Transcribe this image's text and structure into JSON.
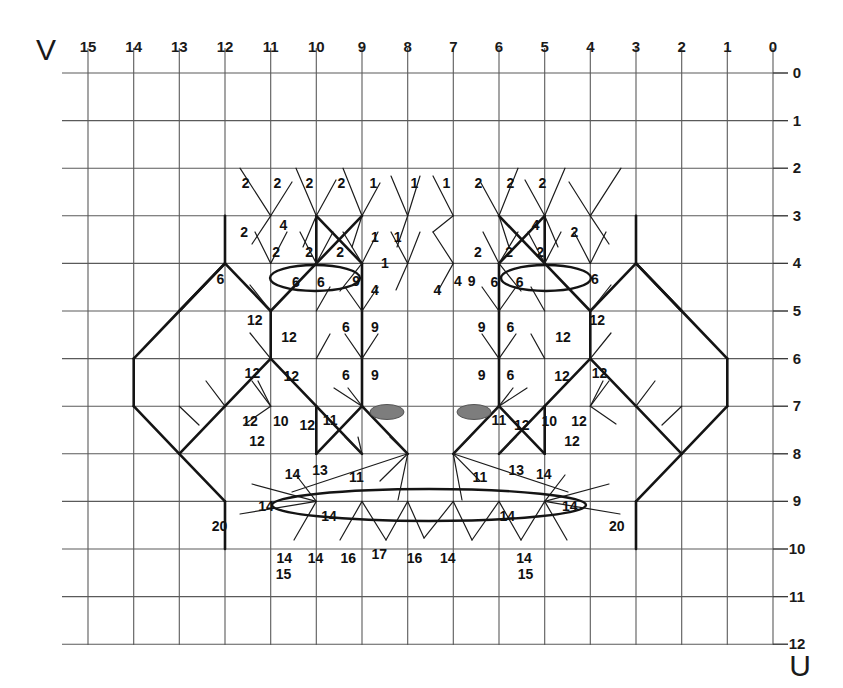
{
  "figure": {
    "axis_v_label": "V",
    "axis_u_label": "U",
    "top_ticks": [
      "15",
      "14",
      "13",
      "12",
      "11",
      "10",
      "9",
      "8",
      "7",
      "6",
      "5",
      "4",
      "3",
      "2",
      "1",
      "0"
    ],
    "right_ticks": [
      "0",
      "1",
      "2",
      "3",
      "4",
      "5",
      "6",
      "7",
      "8",
      "9",
      "10",
      "11",
      "12"
    ],
    "grid_color": "#555555",
    "line_color": "#111111",
    "marker_color": "#7d7d7d"
  },
  "chart_data": {
    "type": "diagram",
    "title": "",
    "xlabel": "V",
    "ylabel": "U",
    "x_ticks": [
      15,
      14,
      13,
      12,
      11,
      10,
      9,
      8,
      7,
      6,
      5,
      4,
      3,
      2,
      1,
      0
    ],
    "y_ticks": [
      0,
      1,
      2,
      3,
      4,
      5,
      6,
      7,
      8,
      9,
      10,
      11,
      12
    ],
    "xlim": [
      15,
      0
    ],
    "ylim": [
      0,
      12
    ],
    "grid": true,
    "x_axis_direction": "descending-left-to-right",
    "annotations": [
      {
        "text": "2",
        "u": 11.55,
        "v": 2.42
      },
      {
        "text": "2",
        "u": 10.85,
        "v": 2.42
      },
      {
        "text": "2",
        "u": 10.15,
        "v": 2.42
      },
      {
        "text": "2",
        "u": 9.45,
        "v": 2.42
      },
      {
        "text": "1",
        "u": 8.75,
        "v": 2.42
      },
      {
        "text": "1",
        "u": 7.85,
        "v": 2.42
      },
      {
        "text": "1",
        "u": 7.15,
        "v": 2.42
      },
      {
        "text": "2",
        "u": 6.45,
        "v": 2.42
      },
      {
        "text": "2",
        "u": 5.75,
        "v": 2.42
      },
      {
        "text": "2",
        "u": 5.05,
        "v": 2.42
      },
      {
        "text": "2",
        "u": 11.58,
        "v": 3.45
      },
      {
        "text": "4",
        "u": 10.72,
        "v": 3.3
      },
      {
        "text": "4",
        "u": 5.2,
        "v": 3.3
      },
      {
        "text": "2",
        "u": 4.35,
        "v": 3.45
      },
      {
        "text": "2",
        "u": 10.88,
        "v": 3.86
      },
      {
        "text": "2",
        "u": 10.16,
        "v": 3.86
      },
      {
        "text": "2",
        "u": 9.48,
        "v": 3.86
      },
      {
        "text": "1",
        "u": 8.72,
        "v": 3.56
      },
      {
        "text": "1",
        "u": 8.22,
        "v": 3.56
      },
      {
        "text": "2",
        "u": 6.46,
        "v": 3.86
      },
      {
        "text": "2",
        "u": 5.78,
        "v": 3.86
      },
      {
        "text": "2",
        "u": 5.1,
        "v": 3.86
      },
      {
        "text": "6",
        "u": 12.1,
        "v": 4.44
      },
      {
        "text": "6",
        "u": 10.45,
        "v": 4.5
      },
      {
        "text": "6",
        "u": 9.9,
        "v": 4.5
      },
      {
        "text": "9",
        "u": 9.13,
        "v": 4.47
      },
      {
        "text": "4",
        "u": 8.72,
        "v": 4.66
      },
      {
        "text": "4",
        "u": 7.35,
        "v": 4.66
      },
      {
        "text": "1",
        "u": 8.5,
        "v": 4.1
      },
      {
        "text": "4",
        "u": 6.9,
        "v": 4.47
      },
      {
        "text": "9",
        "u": 6.6,
        "v": 4.47
      },
      {
        "text": "6",
        "u": 6.1,
        "v": 4.5
      },
      {
        "text": "6",
        "u": 5.55,
        "v": 4.5
      },
      {
        "text": "6",
        "u": 3.9,
        "v": 4.44
      },
      {
        "text": "12",
        "u": 11.35,
        "v": 5.3
      },
      {
        "text": "12",
        "u": 10.6,
        "v": 5.65
      },
      {
        "text": "6",
        "u": 9.35,
        "v": 5.44
      },
      {
        "text": "9",
        "u": 8.72,
        "v": 5.44
      },
      {
        "text": "9",
        "u": 6.38,
        "v": 5.44
      },
      {
        "text": "6",
        "u": 5.75,
        "v": 5.44
      },
      {
        "text": "12",
        "u": 4.6,
        "v": 5.65
      },
      {
        "text": "12",
        "u": 3.85,
        "v": 5.3
      },
      {
        "text": "12",
        "u": 11.4,
        "v": 6.4
      },
      {
        "text": "12",
        "u": 10.55,
        "v": 6.47
      },
      {
        "text": "6",
        "u": 9.35,
        "v": 6.45
      },
      {
        "text": "9",
        "u": 8.72,
        "v": 6.45
      },
      {
        "text": "9",
        "u": 6.38,
        "v": 6.45
      },
      {
        "text": "6",
        "u": 5.75,
        "v": 6.45
      },
      {
        "text": "12",
        "u": 4.62,
        "v": 6.47
      },
      {
        "text": "12",
        "u": 3.8,
        "v": 6.4
      },
      {
        "text": "12",
        "u": 11.45,
        "v": 7.42
      },
      {
        "text": "10",
        "u": 10.78,
        "v": 7.42
      },
      {
        "text": "12",
        "u": 10.2,
        "v": 7.5
      },
      {
        "text": "11",
        "u": 9.7,
        "v": 7.4
      },
      {
        "text": "11",
        "u": 6.0,
        "v": 7.4
      },
      {
        "text": "12",
        "u": 5.5,
        "v": 7.5
      },
      {
        "text": "10",
        "u": 4.9,
        "v": 7.42
      },
      {
        "text": "12",
        "u": 4.25,
        "v": 7.42
      },
      {
        "text": "12",
        "u": 11.3,
        "v": 7.83
      },
      {
        "text": "12",
        "u": 4.4,
        "v": 7.83
      },
      {
        "text": "14",
        "u": 10.52,
        "v": 8.52
      },
      {
        "text": "13",
        "u": 9.92,
        "v": 8.45
      },
      {
        "text": "11",
        "u": 9.12,
        "v": 8.6
      },
      {
        "text": "11",
        "u": 6.42,
        "v": 8.6
      },
      {
        "text": "13",
        "u": 5.62,
        "v": 8.45
      },
      {
        "text": "14",
        "u": 5.02,
        "v": 8.52
      },
      {
        "text": "14",
        "u": 11.1,
        "v": 9.2
      },
      {
        "text": "14",
        "u": 9.72,
        "v": 9.42
      },
      {
        "text": "14",
        "u": 5.82,
        "v": 9.42
      },
      {
        "text": "14",
        "u": 4.45,
        "v": 9.2
      },
      {
        "text": "20",
        "u": 12.12,
        "v": 9.62
      },
      {
        "text": "20",
        "u": 3.42,
        "v": 9.62
      },
      {
        "text": "14",
        "u": 10.7,
        "v": 10.3
      },
      {
        "text": "15",
        "u": 10.72,
        "v": 10.62
      },
      {
        "text": "14",
        "u": 10.02,
        "v": 10.3
      },
      {
        "text": "16",
        "u": 9.3,
        "v": 10.3
      },
      {
        "text": "17",
        "u": 8.62,
        "v": 10.22
      },
      {
        "text": "16",
        "u": 7.85,
        "v": 10.3
      },
      {
        "text": "14",
        "u": 7.12,
        "v": 10.3
      },
      {
        "text": "14",
        "u": 5.45,
        "v": 10.3
      },
      {
        "text": "15",
        "u": 5.42,
        "v": 10.62
      }
    ],
    "markers": [
      {
        "shape": "filled-ellipse",
        "u": 8.3,
        "v": 7.22
      },
      {
        "shape": "filled-ellipse",
        "u": 6.42,
        "v": 7.22
      }
    ],
    "highlight_ellipses": [
      {
        "u_center": 10.2,
        "v_center": 4.6,
        "u_radius": 0.98,
        "v_radius": 0.27
      },
      {
        "u_center": 5.8,
        "v_center": 4.6,
        "u_radius": 0.98,
        "v_radius": 0.27
      },
      {
        "u_center": 8.0,
        "v_center": 9.22,
        "u_radius": 3.42,
        "v_radius": 0.33
      }
    ]
  }
}
